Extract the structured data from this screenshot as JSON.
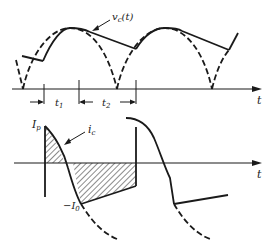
{
  "figure": {
    "top_panel": {
      "curve_label": "v",
      "curve_label_sub": "c",
      "curve_label_suffix": "(t)",
      "axis_label": "t",
      "interval_1_label": "t",
      "interval_1_sub": "1",
      "interval_2_label": "t",
      "interval_2_sub": "2"
    },
    "bottom_panel": {
      "peak_label": "I",
      "peak_label_sub": "p",
      "curve_label": "i",
      "curve_label_sub": "c",
      "negative_label": "−I",
      "negative_label_sub": "0",
      "axis_label": "t"
    }
  }
}
